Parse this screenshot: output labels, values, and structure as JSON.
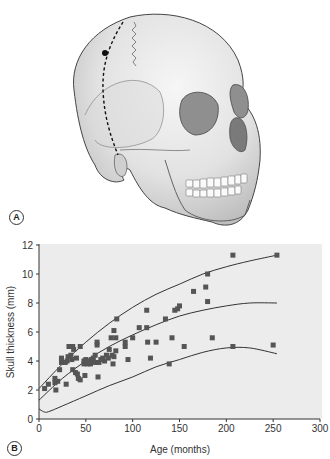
{
  "figure": {
    "panel_a_label": "A",
    "panel_b_label": "B",
    "panel_a_description": "Lateral-oblique illustration of adult skull with dashed line marking measurement path across parietal/temporal region"
  },
  "chart_data": {
    "type": "scatter",
    "title": "",
    "xlabel": "Age (months)",
    "ylabel": "Skull thickness (mm)",
    "xlim": [
      0,
      300
    ],
    "ylim": [
      0,
      12
    ],
    "xticks": [
      0,
      50,
      100,
      150,
      200,
      250,
      300
    ],
    "yticks": [
      0,
      2,
      4,
      6,
      8,
      10,
      12
    ],
    "grid": false,
    "legend": null,
    "points": [
      [
        6,
        2.1
      ],
      [
        10,
        2.4
      ],
      [
        17,
        2.5
      ],
      [
        17,
        2.8
      ],
      [
        18,
        2.0
      ],
      [
        20,
        2.6
      ],
      [
        22,
        3.4
      ],
      [
        24,
        3.9
      ],
      [
        24,
        4.2
      ],
      [
        28,
        3.9
      ],
      [
        29,
        2.4
      ],
      [
        30,
        4.0
      ],
      [
        31,
        4.3
      ],
      [
        32,
        5.0
      ],
      [
        34,
        4.4
      ],
      [
        35,
        4.1
      ],
      [
        36,
        5.0
      ],
      [
        36,
        3.4
      ],
      [
        37,
        4.8
      ],
      [
        39,
        3.2
      ],
      [
        40,
        4.2
      ],
      [
        41,
        3.1
      ],
      [
        42,
        2.8
      ],
      [
        44,
        2.7
      ],
      [
        44,
        5.0
      ],
      [
        48,
        3.8
      ],
      [
        48,
        4.0
      ],
      [
        49,
        3.0
      ],
      [
        50,
        4.1
      ],
      [
        52,
        3.8
      ],
      [
        53,
        4.0
      ],
      [
        55,
        3.8
      ],
      [
        56,
        4.1
      ],
      [
        58,
        4.2
      ],
      [
        60,
        4.4
      ],
      [
        60,
        3.9
      ],
      [
        62,
        5.1
      ],
      [
        62,
        5.3
      ],
      [
        63,
        2.9
      ],
      [
        64,
        3.9
      ],
      [
        66,
        4.1
      ],
      [
        68,
        4.2
      ],
      [
        70,
        4.0
      ],
      [
        72,
        4.4
      ],
      [
        74,
        4.2
      ],
      [
        75,
        4.8
      ],
      [
        77,
        5.6
      ],
      [
        78,
        4.4
      ],
      [
        79,
        3.8
      ],
      [
        80,
        4.3
      ],
      [
        80,
        6.1
      ],
      [
        82,
        4.7
      ],
      [
        82,
        5.6
      ],
      [
        83,
        6.9
      ],
      [
        92,
        5.0
      ],
      [
        92,
        5.3
      ],
      [
        95,
        4.1
      ],
      [
        100,
        5.6
      ],
      [
        107,
        6.3
      ],
      [
        115,
        7.5
      ],
      [
        115,
        6.3
      ],
      [
        116,
        5.3
      ],
      [
        119,
        4.2
      ],
      [
        125,
        5.3
      ],
      [
        135,
        6.9
      ],
      [
        139,
        3.8
      ],
      [
        142,
        5.6
      ],
      [
        145,
        7.5
      ],
      [
        148,
        7.6
      ],
      [
        150,
        7.8
      ],
      [
        155,
        5.0
      ],
      [
        165,
        8.8
      ],
      [
        178,
        9.1
      ],
      [
        180,
        8.1
      ],
      [
        180,
        10.0
      ],
      [
        185,
        5.6
      ],
      [
        207,
        11.3
      ],
      [
        207,
        5.0
      ],
      [
        250,
        5.1
      ],
      [
        254,
        11.3
      ]
    ],
    "curves": [
      {
        "name": "upper",
        "x": [
          0,
          25,
          50,
          75,
          100,
          125,
          150,
          175,
          200,
          225,
          254
        ],
        "y": [
          2.1,
          3.8,
          5.3,
          6.6,
          7.7,
          8.6,
          9.3,
          10.0,
          10.5,
          10.9,
          11.3
        ]
      },
      {
        "name": "middle",
        "x": [
          0,
          25,
          50,
          75,
          100,
          125,
          150,
          175,
          200,
          225,
          254
        ],
        "y": [
          1.3,
          2.8,
          4.0,
          5.0,
          5.8,
          6.5,
          7.1,
          7.5,
          7.8,
          8.0,
          8.0
        ]
      },
      {
        "name": "lower",
        "x": [
          0,
          5,
          10,
          25,
          50,
          75,
          100,
          125,
          150,
          175,
          200,
          225,
          254
        ],
        "y": [
          0.7,
          0.5,
          0.5,
          0.9,
          1.6,
          2.3,
          2.9,
          3.6,
          4.1,
          4.6,
          4.9,
          4.9,
          4.5
        ]
      }
    ]
  }
}
